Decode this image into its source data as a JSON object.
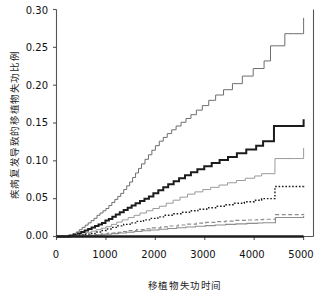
{
  "chart_data": {
    "type": "line",
    "title": "",
    "subtitle": "",
    "xlabel": "移植物失功时间",
    "ylabel": "疾病复发导致的移植物失功比例",
    "xlim": [
      0,
      5200
    ],
    "ylim": [
      0.0,
      0.3
    ],
    "grid": false,
    "legend": "none",
    "step_style": "post",
    "xticks": [
      0,
      1000,
      2000,
      3000,
      4000,
      5000
    ],
    "xtick_labels": [
      "0",
      "1000",
      "2000",
      "3000",
      "4000",
      "5000"
    ],
    "yticks": [
      0.0,
      0.05,
      0.1,
      0.15,
      0.2,
      0.25,
      0.3
    ],
    "ytick_labels": [
      "0.00",
      "0.05",
      "0.10",
      "0.15",
      "0.20",
      "0.25",
      "0.30"
    ],
    "series": [
      {
        "name": "curve-1-gray-top",
        "color": "#6e6e6e",
        "width": 1.0,
        "dash": "none",
        "final_value": 0.289,
        "x": [
          0,
          150,
          250,
          330,
          400,
          460,
          520,
          580,
          640,
          700,
          760,
          820,
          880,
          940,
          1000,
          1060,
          1120,
          1180,
          1240,
          1300,
          1360,
          1420,
          1480,
          1540,
          1600,
          1660,
          1720,
          1790,
          1860,
          1930,
          2000,
          2080,
          2160,
          2240,
          2330,
          2420,
          2520,
          2620,
          2720,
          2830,
          2950,
          3080,
          3220,
          3380,
          3560,
          3760,
          3980,
          4200,
          4330,
          4450,
          4620,
          4800,
          4960,
          5000
        ],
        "y": [
          0.0,
          0.0,
          0.002,
          0.004,
          0.006,
          0.009,
          0.012,
          0.015,
          0.018,
          0.021,
          0.024,
          0.028,
          0.031,
          0.034,
          0.037,
          0.041,
          0.045,
          0.049,
          0.053,
          0.057,
          0.062,
          0.067,
          0.072,
          0.078,
          0.084,
          0.09,
          0.096,
          0.102,
          0.108,
          0.114,
          0.12,
          0.126,
          0.131,
          0.136,
          0.141,
          0.146,
          0.151,
          0.156,
          0.161,
          0.167,
          0.173,
          0.18,
          0.187,
          0.194,
          0.202,
          0.212,
          0.222,
          0.232,
          0.252,
          0.252,
          0.268,
          0.268,
          0.268,
          0.289
        ]
      },
      {
        "name": "curve-2-black-thick",
        "color": "#1c1c1c",
        "width": 2.0,
        "dash": "none",
        "final_value": 0.155,
        "x": [
          0,
          150,
          260,
          350,
          430,
          500,
          570,
          640,
          710,
          780,
          850,
          920,
          990,
          1060,
          1130,
          1200,
          1280,
          1360,
          1440,
          1520,
          1600,
          1690,
          1780,
          1870,
          1960,
          2060,
          2160,
          2260,
          2370,
          2480,
          2600,
          2720,
          2850,
          2990,
          3140,
          3300,
          3470,
          3650,
          3840,
          4040,
          4180,
          4280,
          4400,
          4600,
          4800,
          4960,
          5000
        ],
        "y": [
          0.0,
          0.0,
          0.001,
          0.002,
          0.004,
          0.006,
          0.008,
          0.01,
          0.012,
          0.014,
          0.016,
          0.018,
          0.021,
          0.023,
          0.026,
          0.029,
          0.032,
          0.035,
          0.038,
          0.041,
          0.044,
          0.047,
          0.05,
          0.053,
          0.057,
          0.061,
          0.065,
          0.069,
          0.073,
          0.077,
          0.081,
          0.085,
          0.089,
          0.093,
          0.097,
          0.101,
          0.105,
          0.11,
          0.115,
          0.12,
          0.126,
          0.126,
          0.146,
          0.146,
          0.146,
          0.146,
          0.155
        ]
      },
      {
        "name": "curve-3-lightgray",
        "color": "#9a9a9a",
        "width": 1.0,
        "dash": "none",
        "final_value": 0.117,
        "x": [
          0,
          180,
          300,
          400,
          500,
          600,
          700,
          800,
          900,
          1000,
          1110,
          1220,
          1330,
          1450,
          1570,
          1690,
          1820,
          1950,
          2080,
          2220,
          2360,
          2500,
          2650,
          2800,
          2960,
          3120,
          3290,
          3460,
          3640,
          3820,
          4010,
          4150,
          4280,
          4420,
          4600,
          4820,
          4960,
          5000
        ],
        "y": [
          0.0,
          0.0,
          0.001,
          0.002,
          0.003,
          0.005,
          0.007,
          0.009,
          0.011,
          0.013,
          0.016,
          0.019,
          0.022,
          0.025,
          0.028,
          0.031,
          0.034,
          0.037,
          0.04,
          0.044,
          0.048,
          0.052,
          0.056,
          0.059,
          0.062,
          0.065,
          0.068,
          0.071,
          0.074,
          0.077,
          0.08,
          0.083,
          0.083,
          0.103,
          0.103,
          0.103,
          0.103,
          0.117
        ]
      },
      {
        "name": "curve-4-black-dotted",
        "color": "#1c1c1c",
        "width": 1.4,
        "dash": "1.6 1.8",
        "final_value": 0.068,
        "x": [
          0,
          200,
          330,
          450,
          560,
          670,
          780,
          890,
          1000,
          1120,
          1240,
          1360,
          1490,
          1620,
          1760,
          1900,
          2050,
          2200,
          2360,
          2520,
          2690,
          2860,
          3040,
          3220,
          3410,
          3600,
          3800,
          4000,
          4150,
          4280,
          4420,
          4600,
          4800,
          4960,
          5000
        ],
        "y": [
          0.0,
          0.0,
          0.001,
          0.002,
          0.003,
          0.004,
          0.006,
          0.008,
          0.01,
          0.012,
          0.014,
          0.016,
          0.018,
          0.02,
          0.022,
          0.024,
          0.026,
          0.028,
          0.03,
          0.032,
          0.034,
          0.036,
          0.038,
          0.04,
          0.042,
          0.044,
          0.046,
          0.048,
          0.05,
          0.05,
          0.066,
          0.066,
          0.066,
          0.066,
          0.068
        ]
      },
      {
        "name": "curve-5-gray-dashed",
        "color": "#8d8d8d",
        "width": 1.2,
        "dash": "4 2.5",
        "final_value": 0.03,
        "x": [
          0,
          220,
          380,
          520,
          650,
          780,
          910,
          1040,
          1180,
          1320,
          1470,
          1620,
          1780,
          1940,
          2110,
          2280,
          2460,
          2640,
          2830,
          3020,
          3220,
          3420,
          3630,
          3840,
          4060,
          4180,
          4290,
          4430,
          4620,
          4820,
          4960,
          5000
        ],
        "y": [
          0.0,
          0.0,
          0.0005,
          0.001,
          0.0018,
          0.0026,
          0.0035,
          0.0045,
          0.0055,
          0.0066,
          0.0078,
          0.009,
          0.01,
          0.0113,
          0.0126,
          0.0139,
          0.0152,
          0.0164,
          0.0176,
          0.0186,
          0.0196,
          0.0204,
          0.0212,
          0.0218,
          0.0224,
          0.0228,
          0.0228,
          0.0288,
          0.0288,
          0.0288,
          0.0288,
          0.03
        ]
      },
      {
        "name": "curve-6-gray-solid-low",
        "color": "#8d8d8d",
        "width": 1.1,
        "dash": "none",
        "final_value": 0.027,
        "x": [
          0,
          230,
          400,
          550,
          690,
          830,
          970,
          1110,
          1260,
          1410,
          1570,
          1730,
          1900,
          2070,
          2250,
          2430,
          2620,
          2810,
          3010,
          3210,
          3420,
          3630,
          3850,
          4070,
          4180,
          4290,
          4430,
          4620,
          4820,
          4960,
          5000
        ],
        "y": [
          0.0,
          0.0,
          0.0004,
          0.0009,
          0.0015,
          0.0022,
          0.003,
          0.0038,
          0.0047,
          0.0056,
          0.0066,
          0.0076,
          0.0086,
          0.0096,
          0.0106,
          0.0116,
          0.0126,
          0.0135,
          0.0144,
          0.0152,
          0.016,
          0.0167,
          0.0173,
          0.0179,
          0.0182,
          0.0182,
          0.0252,
          0.0252,
          0.0252,
          0.0252,
          0.027
        ]
      },
      {
        "name": "curve-7-black-baseline",
        "color": "#1c1c1c",
        "width": 2.4,
        "dash": "none",
        "final_value": 0.0,
        "x": [
          0,
          5000
        ],
        "y": [
          0.0,
          0.0
        ]
      }
    ]
  },
  "axes": {
    "frame_color": "#555555",
    "tick_color": "#555555",
    "background": "#ffffff"
  }
}
